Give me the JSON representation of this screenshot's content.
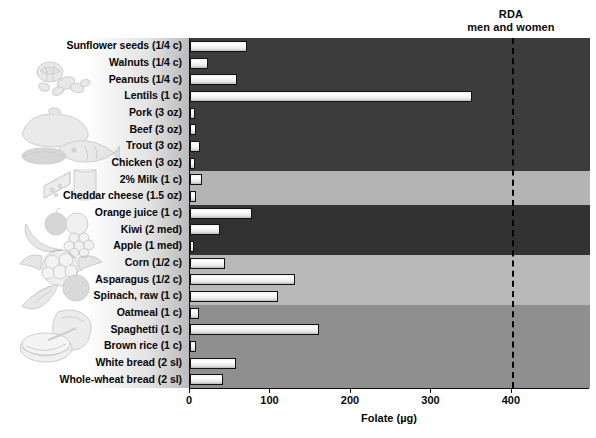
{
  "chart_data": {
    "type": "bar",
    "orientation": "horizontal",
    "title": "",
    "xlabel": "Folate (µg)",
    "ylabel": "",
    "xlim": [
      0,
      497
    ],
    "xticks": [
      0,
      100,
      200,
      300,
      400
    ],
    "grid": false,
    "legend": false,
    "categories": [
      "Sunflower seeds (1/4 c)",
      "Walnuts (1/4 c)",
      "Peanuts (1/4 c)",
      "Lentils (1 c)",
      "Pork (3 oz)",
      "Beef (3 oz)",
      "Trout (3 oz)",
      "Chicken (3 oz)",
      "2% Milk (1 c)",
      "Cheddar cheese (1.5 oz)",
      "Orange juice (1 c)",
      "Kiwi (2 med)",
      "Apple (1 med)",
      "Corn (1/2 c)",
      "Asparagus (1/2 c)",
      "Spinach, raw (1 c)",
      "Oatmeal (1 c)",
      "Spaghetti (1 c)",
      "Brown rice (1 c)",
      "White bread (2 sl)",
      "Whole-wheat bread (2 sl)"
    ],
    "values": [
      71,
      22,
      58,
      350,
      6,
      8,
      12,
      6,
      15,
      7,
      77,
      37,
      5,
      43,
      131,
      109,
      11,
      160,
      7,
      57,
      41
    ],
    "annotations": [
      {
        "name": "rda",
        "value": 400,
        "label_line1": "RDA",
        "label_line2": "men and women",
        "style": "dashed-vertical"
      }
    ],
    "groups": [
      {
        "name": "nuts-seeds-legumes",
        "start": 0,
        "end": 3,
        "shade": "#3c3c3c"
      },
      {
        "name": "meat-fish-poultry",
        "start": 4,
        "end": 7,
        "shade": "#3c3c3c"
      },
      {
        "name": "dairy",
        "start": 8,
        "end": 9,
        "shade": "#b4b4b4"
      },
      {
        "name": "fruits",
        "start": 10,
        "end": 12,
        "shade": "#323232"
      },
      {
        "name": "vegetables",
        "start": 13,
        "end": 15,
        "shade": "#b9b9b9"
      },
      {
        "name": "grains",
        "start": 16,
        "end": 20,
        "shade": "#8f8f8f"
      }
    ]
  },
  "axis": {
    "x_title": "Folate (µg)",
    "tick_labels": [
      "0",
      "100",
      "200",
      "300",
      "400"
    ]
  },
  "rda": {
    "line1": "RDA",
    "line2": "men and women"
  },
  "illustrations": [
    {
      "name": "nuts-illustration",
      "alt": "walnuts and peanuts"
    },
    {
      "name": "meat-fish-illustration",
      "alt": "poultry, steak and fish"
    },
    {
      "name": "dairy-illustration",
      "alt": "cheese wedge and glass of milk"
    },
    {
      "name": "fruit-illustration",
      "alt": "banana, apple and grapes"
    },
    {
      "name": "vegetable-illustration",
      "alt": "cauliflower, carrot and broccoli"
    },
    {
      "name": "grain-illustration",
      "alt": "sliced bread and bowl of cereal"
    }
  ]
}
